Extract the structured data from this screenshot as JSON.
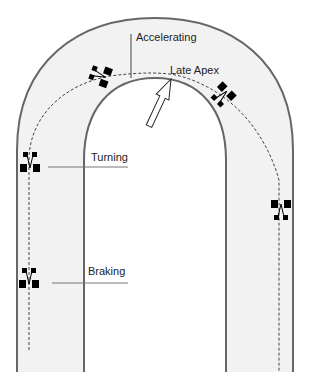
{
  "diagram": {
    "type": "racing-line",
    "colors": {
      "track_fill": "#f2f2f2",
      "track_edge": "#666666",
      "line": "#444444",
      "car": "#000000"
    },
    "labels": {
      "accelerating": "Accelerating",
      "late_apex": "Late Apex",
      "turning": "Turning",
      "braking": "Braking"
    }
  }
}
